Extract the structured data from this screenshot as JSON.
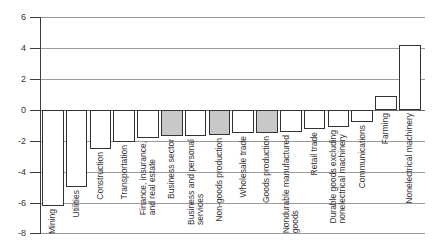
{
  "chart_data": {
    "type": "bar",
    "title": "",
    "xlabel": "",
    "ylabel": "",
    "ylim": [
      -8,
      6
    ],
    "yticks": [
      6,
      4,
      2,
      0,
      -2,
      -4,
      -6,
      -8
    ],
    "grid": true,
    "legend_position": "none",
    "categories": [
      "Mining",
      "Utilities",
      "Construction",
      "Transportation",
      "Finance, insurance,\nand real estate",
      "Business sector",
      "Business and personal\nservices",
      "Non-goods production",
      "Wholesale trade",
      "Goods production",
      "Nondurable manufactured\ngoods",
      "Retail trade",
      "Durable goods excluding\nnonelectrical machinery",
      "Communications",
      "Farming",
      "Nonelectrical machinery"
    ],
    "values": [
      -6.2,
      -5.0,
      -2.5,
      -2.1,
      -1.8,
      -1.7,
      -1.7,
      -1.6,
      -1.5,
      -1.5,
      -1.4,
      -1.2,
      -1.1,
      -0.8,
      0.9,
      4.2
    ],
    "shaded_bar_indices": [
      5,
      7,
      9
    ]
  },
  "colors": {
    "background": "#ffffff",
    "gridline": "#9a9a9a",
    "axis": "#3d3d3d",
    "bar_border": "#333333",
    "bar_fill_white": "#ffffff",
    "bar_fill_shaded": "#c8c8c8",
    "text": "#333333"
  }
}
